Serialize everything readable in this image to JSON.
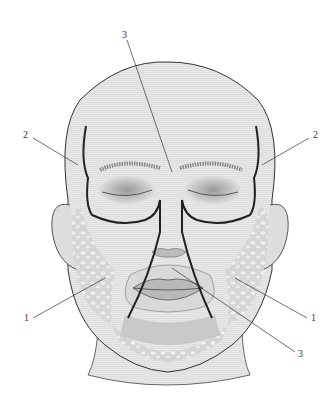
{
  "figure": {
    "labels": [
      {
        "id": "label-3-top",
        "text": "3",
        "x": 122,
        "y": 30
      },
      {
        "id": "label-2-left",
        "text": "2",
        "x": 23,
        "y": 130
      },
      {
        "id": "label-2-right",
        "text": "2",
        "x": 313,
        "y": 130
      },
      {
        "id": "label-1-left",
        "text": "1",
        "x": 24,
        "y": 313
      },
      {
        "id": "label-1-right",
        "text": "1",
        "x": 311,
        "y": 313
      },
      {
        "id": "label-3-bottom",
        "text": "3",
        "x": 298,
        "y": 349
      }
    ],
    "colors": {
      "skin": "#e4e4e4",
      "outline": "#333333",
      "region_line": "#222222",
      "fat": "#d0d0d0"
    }
  }
}
